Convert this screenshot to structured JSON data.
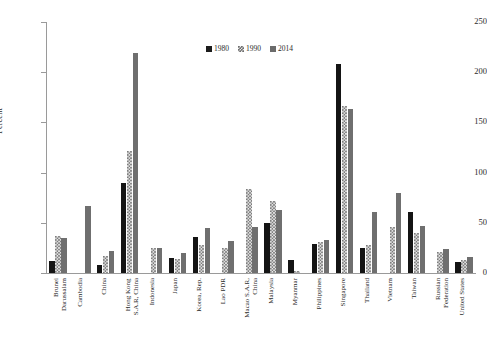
{
  "chart_data": {
    "type": "bar",
    "title": "",
    "xlabel": "",
    "ylabel": "Percent",
    "ylim": [
      0,
      250
    ],
    "yticks": [
      0,
      50,
      100,
      150,
      200,
      250
    ],
    "grid": false,
    "legend_position": "top-center",
    "categories": [
      "Brunei\nDarussalam",
      "Cambodia",
      "China",
      "Hong Kong\nS.A.R, China",
      "Indonesia",
      "Japan",
      "Korea, Rep.",
      "Lao PDR",
      "Macao S.A.R,\nChina",
      "Malaysia",
      "Myanmar",
      "Philippines",
      "Singapore",
      "Thailand",
      "Vietnam",
      "Taiwan",
      "Russian\nFederation",
      "United States"
    ],
    "series": [
      {
        "name": "1980",
        "color": "#141414",
        "values": [
          12,
          0,
          8,
          90,
          0,
          15,
          36,
          0,
          0,
          50,
          13,
          29,
          208,
          25,
          0,
          61,
          0,
          11
        ]
      },
      {
        "name": "1990",
        "color": "#7d7d7d",
        "values": [
          37,
          0,
          17,
          122,
          25,
          14,
          28,
          25,
          84,
          72,
          2,
          31,
          166,
          28,
          46,
          40,
          21,
          13
        ]
      },
      {
        "name": "2014",
        "color": "#6f6f6f",
        "values": [
          35,
          67,
          22,
          219,
          25,
          20,
          45,
          32,
          46,
          63,
          0,
          33,
          163,
          61,
          80,
          47,
          24,
          16
        ]
      }
    ]
  },
  "legend": {
    "entries": [
      {
        "label": "1980",
        "swatch": "solid-black-square"
      },
      {
        "label": "1990",
        "swatch": "checkered-square"
      },
      {
        "label": "2014",
        "swatch": "solid-gray-square"
      }
    ]
  },
  "axis": {
    "y_title": "Percent",
    "y_tick_labels": [
      "0",
      "50",
      "100",
      "150",
      "200",
      "250"
    ]
  }
}
